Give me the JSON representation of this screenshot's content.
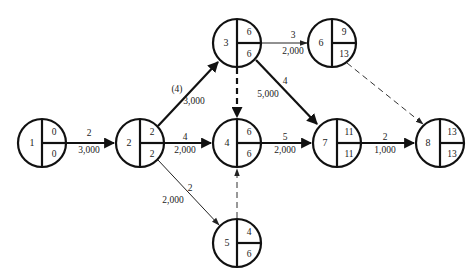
{
  "diagram": {
    "type": "activity-on-arrow network (CPM)",
    "nodes": [
      {
        "id": "1",
        "x": 42,
        "y": 143,
        "top": "0",
        "bottom": "0"
      },
      {
        "id": "2",
        "x": 140,
        "y": 143,
        "top": "2",
        "bottom": "2"
      },
      {
        "id": "3",
        "x": 237,
        "y": 43,
        "top": "6",
        "bottom": "6"
      },
      {
        "id": "4",
        "x": 237,
        "y": 143,
        "top": "6",
        "bottom": "6"
      },
      {
        "id": "5",
        "x": 237,
        "y": 243,
        "top": "4",
        "bottom": "6"
      },
      {
        "id": "6",
        "x": 332,
        "y": 43,
        "top": "9",
        "bottom": "13"
      },
      {
        "id": "7",
        "x": 337,
        "y": 143,
        "top": "11",
        "bottom": "11"
      },
      {
        "id": "8",
        "x": 440,
        "y": 143,
        "top": "13",
        "bottom": "13"
      }
    ],
    "edges": [
      {
        "from": "1",
        "to": "2",
        "duration": "2",
        "cost": "3,000",
        "style": "critical"
      },
      {
        "from": "2",
        "to": "3",
        "duration": "(4)",
        "cost": "3,000",
        "style": "critical"
      },
      {
        "from": "2",
        "to": "4",
        "duration": "4",
        "cost": "2,000",
        "style": "critical"
      },
      {
        "from": "2",
        "to": "5",
        "duration": "2",
        "cost": "2,000",
        "style": "normal"
      },
      {
        "from": "3",
        "to": "4",
        "duration": "",
        "cost": "",
        "style": "dummy-critical"
      },
      {
        "from": "3",
        "to": "6",
        "duration": "3",
        "cost": "2,000",
        "style": "normal"
      },
      {
        "from": "3",
        "to": "7",
        "duration": "4",
        "cost": "5,000",
        "style": "critical"
      },
      {
        "from": "4",
        "to": "7",
        "duration": "5",
        "cost": "2,000",
        "style": "critical"
      },
      {
        "from": "5",
        "to": "4",
        "duration": "",
        "cost": "",
        "style": "dummy"
      },
      {
        "from": "6",
        "to": "8",
        "duration": "",
        "cost": "",
        "style": "dummy"
      },
      {
        "from": "7",
        "to": "8",
        "duration": "2",
        "cost": "1,000",
        "style": "critical"
      }
    ]
  }
}
